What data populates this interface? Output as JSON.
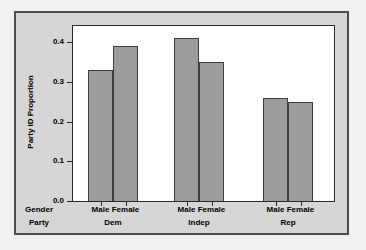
{
  "chart": {
    "colors": {
      "page_bg": "#f1f1f1",
      "panel_bg": "#d6d6d6",
      "panel_border": "#4d4d4d",
      "plot_bg": "#ffffff",
      "plot_border": "#2a2a2a",
      "bar_fill": "#9c9c9c",
      "bar_border": "#3d3d3d",
      "text": "#000000"
    }
  },
  "chart_data": {
    "type": "bar",
    "title": "",
    "ylabel": "Party ID Proportion",
    "xlabel_rows": [
      "Gender",
      "Party"
    ],
    "categories": [
      "Dem",
      "Indep",
      "Rep"
    ],
    "gender_levels": [
      "Male",
      "Female"
    ],
    "series": [
      {
        "name": "Male",
        "values": [
          0.33,
          0.41,
          0.26
        ]
      },
      {
        "name": "Female",
        "values": [
          0.39,
          0.35,
          0.25
        ]
      }
    ],
    "ylim": [
      0,
      0.44
    ],
    "yticks": [
      0.0,
      0.1,
      0.2,
      0.3,
      0.4
    ],
    "ytick_format": "0.1f",
    "legend": "none",
    "grid": false,
    "bar_orientation": "vertical",
    "grouping": "gender nested within party"
  }
}
